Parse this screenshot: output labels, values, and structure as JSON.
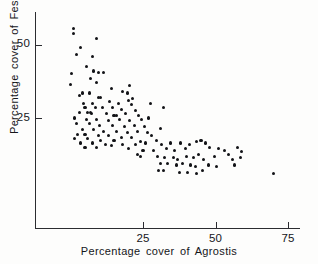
{
  "chart_data": {
    "type": "scatter",
    "title": "",
    "xlabel": "Percentage  cover  of  Agrostis",
    "ylabel": "Percentage  cover  of  Festuca",
    "xlim": [
      0,
      78
    ],
    "ylim": [
      0,
      60
    ],
    "xticks": [
      25,
      50,
      75
    ],
    "yticks": [
      25,
      50
    ],
    "xtick_labels": [
      "25",
      "50",
      "75"
    ],
    "ytick_labels": [
      "25",
      "50"
    ],
    "grid": false,
    "legend": null,
    "marker": "filled-circle",
    "marker_color": "#121317",
    "n_points": 136,
    "relationship": "negative",
    "points": [
      [
        1.0,
        55.5
      ],
      [
        1.0,
        53.6
      ],
      [
        9.0,
        52.0
      ],
      [
        3.5,
        49.0
      ],
      [
        2.0,
        46.5
      ],
      [
        7.5,
        46.0
      ],
      [
        5.5,
        42.5
      ],
      [
        8.0,
        41.0
      ],
      [
        9.5,
        40.5
      ],
      [
        11.5,
        40.5
      ],
      [
        0.5,
        40.0
      ],
      [
        7.0,
        38.5
      ],
      [
        9.0,
        37.0
      ],
      [
        0.0,
        36.5
      ],
      [
        20.5,
        36.0
      ],
      [
        14.0,
        35.0
      ],
      [
        18.0,
        34.0
      ],
      [
        4.0,
        33.5
      ],
      [
        6.5,
        33.5
      ],
      [
        19.5,
        33.5
      ],
      [
        3.0,
        32.5
      ],
      [
        9.5,
        32.0
      ],
      [
        10.5,
        32.0
      ],
      [
        21.5,
        31.5
      ],
      [
        20.0,
        31.0
      ],
      [
        13.5,
        30.5
      ],
      [
        4.5,
        30.0
      ],
      [
        7.5,
        30.0
      ],
      [
        16.5,
        30.0
      ],
      [
        21.0,
        29.5
      ],
      [
        27.5,
        30.0
      ],
      [
        5.0,
        28.5
      ],
      [
        8.5,
        28.5
      ],
      [
        11.0,
        28.5
      ],
      [
        14.5,
        28.5
      ],
      [
        17.5,
        28.0
      ],
      [
        22.5,
        27.5
      ],
      [
        32.0,
        28.5
      ],
      [
        3.0,
        27.0
      ],
      [
        6.0,
        27.0
      ],
      [
        7.0,
        26.8
      ],
      [
        7.2,
        26.5
      ],
      [
        12.5,
        26.5
      ],
      [
        15.0,
        26.0
      ],
      [
        16.0,
        26.0
      ],
      [
        19.0,
        26.5
      ],
      [
        23.5,
        26.0
      ],
      [
        1.5,
        25.0
      ],
      [
        5.5,
        24.5
      ],
      [
        9.0,
        24.5
      ],
      [
        13.0,
        24.0
      ],
      [
        17.0,
        24.5
      ],
      [
        20.5,
        24.0
      ],
      [
        24.5,
        24.5
      ],
      [
        27.0,
        25.0
      ],
      [
        2.0,
        23.0
      ],
      [
        6.5,
        23.0
      ],
      [
        10.0,
        22.5
      ],
      [
        14.5,
        22.5
      ],
      [
        18.5,
        22.0
      ],
      [
        22.0,
        22.5
      ],
      [
        25.5,
        22.0
      ],
      [
        4.0,
        21.0
      ],
      [
        8.0,
        21.0
      ],
      [
        11.5,
        20.5
      ],
      [
        16.0,
        20.5
      ],
      [
        19.5,
        20.0
      ],
      [
        23.0,
        20.5
      ],
      [
        26.5,
        20.0
      ],
      [
        31.0,
        21.5
      ],
      [
        2.5,
        19.5
      ],
      [
        5.0,
        19.5
      ],
      [
        9.5,
        19.0
      ],
      [
        13.0,
        19.0
      ],
      [
        17.5,
        18.5
      ],
      [
        21.0,
        18.5
      ],
      [
        28.0,
        19.0
      ],
      [
        1.5,
        18.0
      ],
      [
        6.0,
        18.0
      ],
      [
        10.5,
        17.5
      ],
      [
        15.0,
        17.5
      ],
      [
        24.0,
        17.0
      ],
      [
        29.5,
        17.5
      ],
      [
        3.5,
        16.5
      ],
      [
        7.5,
        16.5
      ],
      [
        12.0,
        16.0
      ],
      [
        18.0,
        16.0
      ],
      [
        22.5,
        16.0
      ],
      [
        26.0,
        16.5
      ],
      [
        31.5,
        16.0
      ],
      [
        34.5,
        16.5
      ],
      [
        38.0,
        16.5
      ],
      [
        41.0,
        16.0
      ],
      [
        43.5,
        17.0
      ],
      [
        45.0,
        17.5
      ],
      [
        46.5,
        16.5
      ],
      [
        5.0,
        15.0
      ],
      [
        9.0,
        15.0
      ],
      [
        14.0,
        15.5
      ],
      [
        20.0,
        14.5
      ],
      [
        25.0,
        14.0
      ],
      [
        28.5,
        14.0
      ],
      [
        33.0,
        14.5
      ],
      [
        36.0,
        14.0
      ],
      [
        39.5,
        14.5
      ],
      [
        48.0,
        15.0
      ],
      [
        51.0,
        14.5
      ],
      [
        53.0,
        14.0
      ],
      [
        57.5,
        15.0
      ],
      [
        59.0,
        13.5
      ],
      [
        23.0,
        12.5
      ],
      [
        24.0,
        12.0
      ],
      [
        30.0,
        12.0
      ],
      [
        32.5,
        11.5
      ],
      [
        35.5,
        11.5
      ],
      [
        37.0,
        11.0
      ],
      [
        40.0,
        12.0
      ],
      [
        42.5,
        11.5
      ],
      [
        44.0,
        12.5
      ],
      [
        46.0,
        11.0
      ],
      [
        49.5,
        12.0
      ],
      [
        54.5,
        12.5
      ],
      [
        56.0,
        11.0
      ],
      [
        58.5,
        11.5
      ],
      [
        31.0,
        9.5
      ],
      [
        33.5,
        9.5
      ],
      [
        36.5,
        9.0
      ],
      [
        38.5,
        9.5
      ],
      [
        41.5,
        9.0
      ],
      [
        43.0,
        8.5
      ],
      [
        47.5,
        9.0
      ],
      [
        50.5,
        8.5
      ],
      [
        56.5,
        9.0
      ],
      [
        30.5,
        7.0
      ],
      [
        32.0,
        7.0
      ],
      [
        37.5,
        6.5
      ],
      [
        40.5,
        6.5
      ],
      [
        43.5,
        6.0
      ],
      [
        45.5,
        7.0
      ],
      [
        70.0,
        6.0
      ]
    ]
  }
}
